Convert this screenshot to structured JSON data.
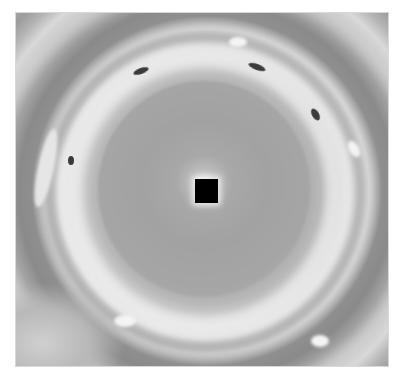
{
  "image": {
    "description": "Grayscale planetary polar vortex photograph with concentric cloud bands",
    "background": "#ffffff",
    "photo_bounds": {
      "left": 15,
      "top": 12,
      "right": 389,
      "bottom": 367
    },
    "colors": {
      "inner_disk": "#a5a5a5",
      "bright_ring": "#eeeeee",
      "dark_ring": "#8a8a8a",
      "outer_bands": "#a9a9a9",
      "center_mask": "#000000"
    },
    "features": {
      "center_mask": {
        "x": 194,
        "y": 178,
        "w": 23,
        "h": 24
      },
      "dark_spots": [
        {
          "x": 140,
          "y": 70
        },
        {
          "x": 255,
          "y": 65
        },
        {
          "x": 316,
          "y": 112
        },
        {
          "x": 70,
          "y": 160
        }
      ],
      "white_ovals": [
        {
          "x": 235,
          "y": 40
        },
        {
          "x": 353,
          "y": 145
        },
        {
          "x": 45,
          "y": 160
        },
        {
          "x": 120,
          "y": 320
        },
        {
          "x": 315,
          "y": 338
        }
      ]
    }
  }
}
